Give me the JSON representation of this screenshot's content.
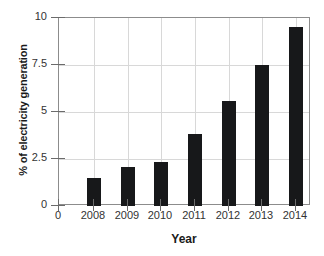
{
  "chart_data": {
    "type": "bar",
    "title": "",
    "subtitle": "",
    "xlabel": "Year",
    "ylabel": "% of electricity generation",
    "categories": [
      "2008",
      "2009",
      "2010",
      "2011",
      "2012",
      "2013",
      "2014"
    ],
    "values": [
      1.5,
      2.05,
      2.35,
      3.85,
      5.6,
      7.5,
      9.5
    ],
    "series": [
      {
        "name": "% of electricity generation",
        "values": [
          1.5,
          2.05,
          2.35,
          3.85,
          5.6,
          7.5,
          9.5
        ]
      }
    ],
    "ylim": [
      0,
      10
    ],
    "y_ticks": [
      "0",
      "2.5",
      "5",
      "7.5",
      "10"
    ],
    "y_tick_values": [
      0,
      2.5,
      5,
      7.5,
      10
    ],
    "x_origin_label": "0",
    "x_tick_labels": [
      "0",
      "2008",
      "2009",
      "2010",
      "2011",
      "2012",
      "2013",
      "2014"
    ],
    "grid": "both",
    "legend": "none",
    "bar_color": "#17181a",
    "grid_color": "#d8d8d8",
    "axis_color": "#8c8c8c"
  }
}
